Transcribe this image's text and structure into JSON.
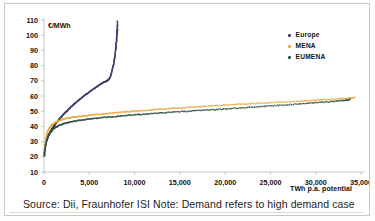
{
  "figure": {
    "caption": "Source: Dii, Fraunhofer ISI  Note: Demand refers to high demand case"
  },
  "legend": {
    "position": "top-right",
    "items": [
      {
        "label": "Europe",
        "color": "#3b3b6e"
      },
      {
        "label": "MENA",
        "color": "#e7a83c"
      },
      {
        "label": "EUMENA",
        "color": "#2f4f3e"
      }
    ]
  },
  "chart_data": {
    "type": "scatter",
    "title": "",
    "subtitle": "",
    "xlabel": "TWh p.a. potential",
    "ylabel": "€/MWh",
    "xlim": [
      0,
      35000
    ],
    "ylim": [
      10,
      110
    ],
    "grid": false,
    "xticks": [
      0,
      5000,
      10000,
      15000,
      20000,
      25000,
      30000,
      35000
    ],
    "xticklabels": [
      "0",
      "5,000",
      "10,000",
      "15,000",
      "20,000",
      "25,000",
      "30,000",
      "35,000"
    ],
    "yticks": [
      10,
      20,
      30,
      40,
      50,
      60,
      70,
      80,
      90,
      100,
      110
    ],
    "yticklabels": [
      "10",
      "20",
      "30",
      "40",
      "50",
      "60",
      "70",
      "80",
      "90",
      "100",
      "110"
    ],
    "annotations": [],
    "series": [
      {
        "name": "Europe",
        "color": "#3b3b6e",
        "x": [
          30,
          60,
          95,
          130,
          170,
          215,
          265,
          320,
          385,
          455,
          530,
          615,
          700,
          800,
          900,
          1010,
          1120,
          1240,
          1370,
          1500,
          1640,
          1780,
          1930,
          2080,
          2240,
          2400,
          2570,
          2740,
          2920,
          3100,
          3290,
          3480,
          3680,
          3880,
          4090,
          4300,
          4520,
          4740,
          4970,
          5200,
          5440,
          5680,
          5920,
          6150,
          6370,
          6570,
          6760,
          6930,
          7080,
          7210,
          7330,
          7430,
          7520,
          7600,
          7670,
          7730,
          7790,
          7840,
          7880,
          7920,
          7950,
          7980,
          8010,
          8030,
          8050,
          8070,
          8085,
          8095,
          8105,
          8115
        ],
        "y": [
          20.5,
          22.5,
          24.5,
          26.5,
          28.0,
          29.5,
          30.5,
          31.5,
          32.5,
          33.5,
          34.5,
          35.5,
          36.5,
          37.5,
          38.5,
          39.5,
          40.5,
          41.5,
          42.5,
          43.5,
          44.5,
          45.5,
          46.5,
          47.5,
          48.5,
          49.5,
          50.5,
          51.5,
          52.5,
          53.5,
          54.5,
          55.5,
          56.5,
          57.5,
          58.5,
          59.5,
          60.5,
          61.5,
          62.5,
          63.5,
          64.5,
          65.5,
          66.5,
          67.5,
          68.3,
          69.0,
          69.5,
          70.0,
          70.5,
          71.5,
          73.0,
          75.0,
          77.0,
          79.0,
          81.0,
          83.0,
          85.0,
          87.0,
          89.0,
          91.0,
          93.0,
          95.0,
          97.0,
          99.0,
          100.5,
          102.0,
          103.0,
          104.0,
          106.5,
          109.5
        ]
      },
      {
        "name": "MENA",
        "color": "#e7a83c",
        "x": [
          40,
          90,
          150,
          230,
          330,
          450,
          600,
          780,
          980,
          1200,
          1450,
          1720,
          2010,
          2320,
          2650,
          3000,
          3380,
          3780,
          4200,
          4650,
          5120,
          5600,
          6100,
          6620,
          7160,
          7720,
          8300,
          8900,
          9520,
          10150,
          10800,
          11470,
          12150,
          12850,
          13570,
          14300,
          15050,
          15820,
          16600,
          17400,
          18220,
          19060,
          19920,
          20800,
          21700,
          22620,
          23560,
          24520,
          25500,
          26500,
          27500,
          28450,
          29350,
          30200,
          31000,
          31800,
          32600,
          33300,
          33900,
          34300
        ],
        "y": [
          24.0,
          27.0,
          30.0,
          33.0,
          35.5,
          37.5,
          39.0,
          40.5,
          41.5,
          42.5,
          43.3,
          44.0,
          44.6,
          45.1,
          45.5,
          45.9,
          46.2,
          46.5,
          46.8,
          47.1,
          47.4,
          47.7,
          48.0,
          48.3,
          48.6,
          48.9,
          49.2,
          49.5,
          49.8,
          50.1,
          50.4,
          50.7,
          51.0,
          51.3,
          51.6,
          51.9,
          52.2,
          52.5,
          52.8,
          53.1,
          53.4,
          53.7,
          54.0,
          54.3,
          54.6,
          54.9,
          55.2,
          55.5,
          55.8,
          56.1,
          56.4,
          56.7,
          57.0,
          57.3,
          57.6,
          57.9,
          58.2,
          58.5,
          58.8,
          59.2
        ]
      },
      {
        "name": "EUMENA",
        "color": "#2f4f3e",
        "x": [
          35,
          80,
          140,
          215,
          310,
          425,
          560,
          720,
          910,
          1120,
          1360,
          1620,
          1900,
          2200,
          2520,
          2860,
          3220,
          3600,
          4000,
          4420,
          4870,
          5340,
          5830,
          6340,
          6870,
          7420,
          7990,
          8580,
          9190,
          9820,
          10470,
          11140,
          11830,
          12540,
          13270,
          14020,
          14790,
          15580,
          16390,
          17220,
          18070,
          18940,
          19830,
          20740,
          21670,
          22620,
          23590,
          24580,
          25590,
          26620,
          27650,
          28650,
          29600,
          30500,
          31350,
          32150,
          32850,
          33400,
          33800
        ],
        "y": [
          21.0,
          23.5,
          26.0,
          28.5,
          31.0,
          33.0,
          34.8,
          36.3,
          37.6,
          38.7,
          39.7,
          40.5,
          41.2,
          41.8,
          42.4,
          42.9,
          43.3,
          43.7,
          44.1,
          44.5,
          44.8,
          45.1,
          45.4,
          45.7,
          46.0,
          46.3,
          46.6,
          46.9,
          47.2,
          47.5,
          47.8,
          48.1,
          48.4,
          48.7,
          49.0,
          49.3,
          49.6,
          49.9,
          50.2,
          50.5,
          50.8,
          51.1,
          51.4,
          51.8,
          52.2,
          52.6,
          53.0,
          53.4,
          53.8,
          54.2,
          54.6,
          55.0,
          55.4,
          55.8,
          56.2,
          56.6,
          57.0,
          57.4,
          57.8
        ]
      }
    ]
  }
}
